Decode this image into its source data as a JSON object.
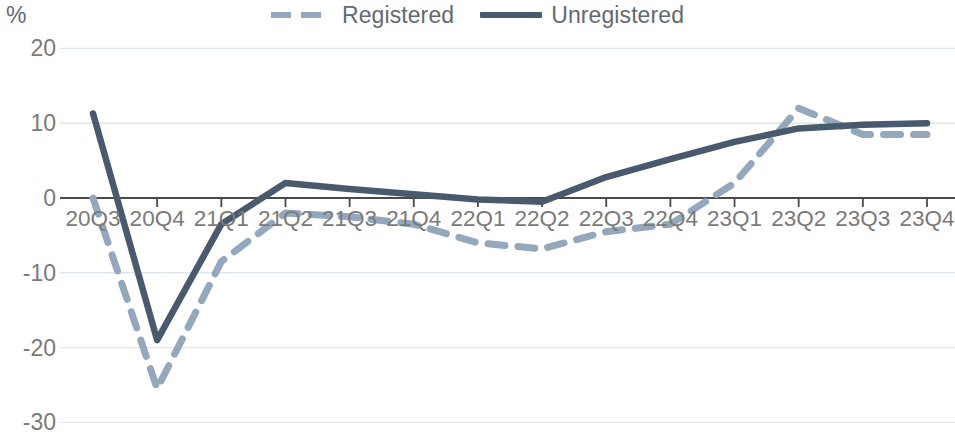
{
  "chart_data": {
    "type": "line",
    "title": "",
    "xlabel": "",
    "ylabel": "%",
    "unit_label": "%",
    "categories": [
      "20Q3",
      "20Q4",
      "21Q1",
      "21Q2",
      "21Q3",
      "21Q4",
      "22Q1",
      "22Q2",
      "22Q3",
      "22Q4",
      "23Q1",
      "23Q2",
      "23Q3",
      "23Q4"
    ],
    "ylim": [
      -30,
      20
    ],
    "yticks": [
      20,
      10,
      0,
      -10,
      -20,
      -30
    ],
    "ytick_labels": [
      "20",
      "10",
      "0",
      "-10",
      "-20",
      "-30"
    ],
    "grid": true,
    "legend_position": "top-center",
    "series": [
      {
        "name": "Registered",
        "style": "dashed",
        "color": "#93a8bc",
        "values": [
          0,
          -25.5,
          -8.5,
          -2.0,
          -2.5,
          -3.5,
          -6.0,
          -6.8,
          -4.5,
          -3.5,
          2.0,
          12.0,
          8.5,
          8.5
        ]
      },
      {
        "name": "Unregistered",
        "style": "solid",
        "color": "#4a5a6e",
        "values": [
          11.3,
          -19.0,
          -3.5,
          2.0,
          1.2,
          0.5,
          -0.2,
          -0.5,
          2.8,
          5.2,
          7.5,
          9.3,
          9.8,
          10.0
        ]
      }
    ],
    "colors": {
      "registered": "#93a8bc",
      "unregistered": "#4a5a6e",
      "axis": "#4a4a4a",
      "grid": "#dfe6ec",
      "text": "#7a7a7a"
    }
  },
  "legend": {
    "items": [
      {
        "label": "Registered",
        "swatch": "dashed-line-swatch"
      },
      {
        "label": "Unregistered",
        "swatch": "solid-line-swatch"
      }
    ]
  },
  "axes": {
    "unit": "%",
    "y_labels": [
      "20",
      "10",
      "0",
      "-10",
      "-20",
      "-30"
    ],
    "x_labels": [
      "20Q3",
      "20Q4",
      "21Q1",
      "21Q2",
      "21Q3",
      "21Q4",
      "22Q1",
      "22Q2",
      "22Q3",
      "22Q4",
      "23Q1",
      "23Q2",
      "23Q3",
      "23Q4"
    ]
  }
}
